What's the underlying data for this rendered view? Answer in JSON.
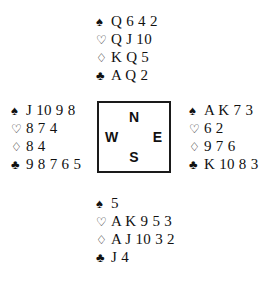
{
  "diagram": {
    "type": "bridge-deal-diagram",
    "suit_glyphs": {
      "spades": "♠",
      "hearts": "♡",
      "diamonds": "♢",
      "clubs": "♣"
    },
    "compass": {
      "north": "N",
      "west": "W",
      "east": "E",
      "south": "S"
    },
    "hands": {
      "north": {
        "spades": "Q 6 4 2",
        "hearts": "Q J 10",
        "diamonds": "K Q 5",
        "clubs": "A Q 2"
      },
      "west": {
        "spades": "J 10 9 8",
        "hearts": "8 7 4",
        "diamonds": "8 4",
        "clubs": "9 8 7 6 5"
      },
      "east": {
        "spades": "A K 7 3",
        "hearts": "6 2",
        "diamonds": "9 7 6",
        "clubs": "K 10 8 3"
      },
      "south": {
        "spades": "5",
        "hearts": "A K 9 5 3",
        "diamonds": "A J 10 3 2",
        "clubs": "J 4"
      }
    }
  }
}
